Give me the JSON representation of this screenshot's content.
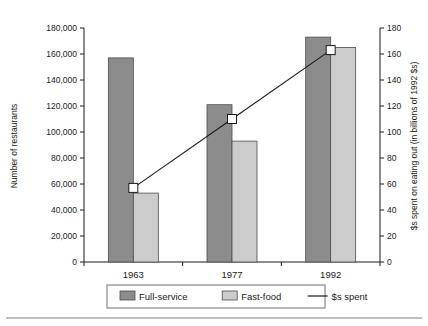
{
  "chart_data": {
    "type": "bar",
    "title": "",
    "subtitle": "",
    "categories": [
      "1963",
      "1977",
      "1992"
    ],
    "xlabel": "",
    "ylabel": "Number of restaurants",
    "y2label": "$s spent on eating out (in billions of 1992 $s)",
    "ylim": [
      0,
      180000
    ],
    "y2lim": [
      0,
      180
    ],
    "grid": false,
    "legend_position": "bottom",
    "y_ticks": [
      "0",
      "20,000",
      "40,000",
      "60,000",
      "80,000",
      "100,000",
      "120,000",
      "140,000",
      "160,000",
      "180,000"
    ],
    "y_tick_values": [
      0,
      20000,
      40000,
      60000,
      80000,
      100000,
      120000,
      140000,
      160000,
      180000
    ],
    "y2_ticks": [
      "0",
      "20",
      "40",
      "60",
      "80",
      "100",
      "120",
      "140",
      "160",
      "180"
    ],
    "y2_tick_values": [
      0,
      20,
      40,
      60,
      80,
      100,
      120,
      140,
      160,
      180
    ],
    "series": [
      {
        "name": "Full-service",
        "type": "bar",
        "axis": "left",
        "color": "#8c8c8c",
        "values": [
          157000,
          121000,
          173000
        ]
      },
      {
        "name": "Fast-food",
        "type": "bar",
        "axis": "left",
        "color": "#cccccc",
        "values": [
          53000,
          93000,
          165000
        ]
      },
      {
        "name": "$s spent",
        "type": "line",
        "axis": "right",
        "color": "#1a1a1a",
        "values": [
          57,
          110,
          163
        ]
      }
    ]
  },
  "legend": {
    "items": [
      {
        "label": "Full-service",
        "marker": "swatch",
        "color": "#8c8c8c"
      },
      {
        "label": "Fast-food",
        "marker": "swatch",
        "color": "#cccccc"
      },
      {
        "label": "$s spent",
        "marker": "line",
        "color": "#1a1a1a"
      }
    ]
  }
}
